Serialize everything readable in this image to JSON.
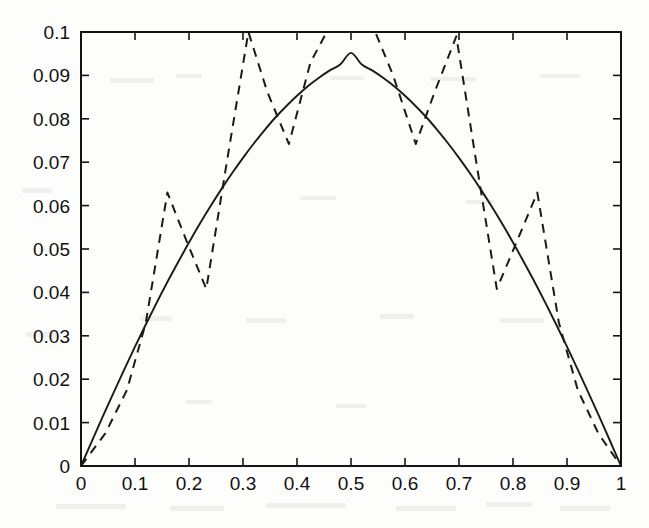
{
  "figure": {
    "background_color": "#fdfdfc",
    "axis_color": "#141414",
    "plot_area": {
      "left": 81,
      "top": 32,
      "right": 621,
      "bottom": 466
    }
  },
  "chart_data": {
    "type": "line",
    "title": "",
    "xlabel": "",
    "ylabel": "",
    "xlim": [
      0,
      1
    ],
    "ylim": [
      0,
      0.1
    ],
    "grid": false,
    "legend": null,
    "xticks": [
      0,
      0.1,
      0.2,
      0.3,
      0.4,
      0.5,
      0.6,
      0.7,
      0.8,
      0.9,
      1
    ],
    "xtick_labels": [
      "0",
      "0.1",
      "0.2",
      "0.3",
      "0.4",
      "0.5",
      "0.6",
      "0.7",
      "0.8",
      "0.9",
      "1"
    ],
    "yticks": [
      0,
      0.01,
      0.02,
      0.03,
      0.04,
      0.05,
      0.06,
      0.07,
      0.08,
      0.09,
      0.1
    ],
    "ytick_labels": [
      "0",
      "0.01",
      "0.02",
      "0.03",
      "0.04",
      "0.05",
      "0.06",
      "0.07",
      "0.08",
      "0.09",
      "0.1"
    ],
    "series": [
      {
        "name": "smooth-solution",
        "style": "solid",
        "color": "#1a1a1a",
        "x": [
          0.0,
          0.02,
          0.04,
          0.06,
          0.08,
          0.1,
          0.12,
          0.14,
          0.16,
          0.18,
          0.2,
          0.22,
          0.24,
          0.26,
          0.28,
          0.3,
          0.32,
          0.34,
          0.36,
          0.38,
          0.4,
          0.42,
          0.44,
          0.46,
          0.48,
          0.5,
          0.52,
          0.54,
          0.56,
          0.58,
          0.6,
          0.62,
          0.64,
          0.66,
          0.68,
          0.7,
          0.72,
          0.74,
          0.76,
          0.78,
          0.8,
          0.82,
          0.84,
          0.86,
          0.88,
          0.9,
          0.92,
          0.94,
          0.96,
          0.98,
          1.0
        ],
        "y": [
          0.0,
          0.0057,
          0.0113,
          0.0168,
          0.0222,
          0.0275,
          0.0326,
          0.0376,
          0.0424,
          0.047,
          0.0515,
          0.0558,
          0.0599,
          0.0638,
          0.0675,
          0.071,
          0.0743,
          0.0774,
          0.0803,
          0.0829,
          0.0853,
          0.0875,
          0.0894,
          0.0911,
          0.0925,
          0.0952,
          0.0925,
          0.0911,
          0.0894,
          0.0875,
          0.0853,
          0.0829,
          0.0803,
          0.0774,
          0.0743,
          0.071,
          0.0675,
          0.0638,
          0.0599,
          0.0558,
          0.0515,
          0.047,
          0.0424,
          0.0376,
          0.0326,
          0.0275,
          0.0222,
          0.0168,
          0.0113,
          0.0057,
          0.0
        ]
      },
      {
        "name": "oscillatory-solution",
        "style": "dashed",
        "color": "#1a1a1a",
        "x": [
          0.0,
          0.045,
          0.085,
          0.12,
          0.16,
          0.195,
          0.232,
          0.27,
          0.31,
          0.345,
          0.385,
          0.425,
          0.455,
          0.5,
          0.545,
          0.578,
          0.62,
          0.655,
          0.695,
          0.732,
          0.77,
          0.808,
          0.845,
          0.885,
          0.92,
          0.958,
          1.0
        ],
        "y": [
          0.0,
          0.0075,
          0.0175,
          0.033,
          0.063,
          0.052,
          0.0408,
          0.07,
          0.1,
          0.0862,
          0.0742,
          0.093,
          0.1,
          0.1,
          0.1,
          0.09,
          0.0742,
          0.0862,
          0.099,
          0.07,
          0.0408,
          0.052,
          0.063,
          0.033,
          0.0175,
          0.0075,
          0.0
        ]
      }
    ],
    "annotations": {
      "dashed_clipped_at_top": true,
      "clip_x_range": [
        0.455,
        0.545
      ],
      "solid_peak": {
        "x": 0.5,
        "y": 0.0952
      }
    }
  }
}
